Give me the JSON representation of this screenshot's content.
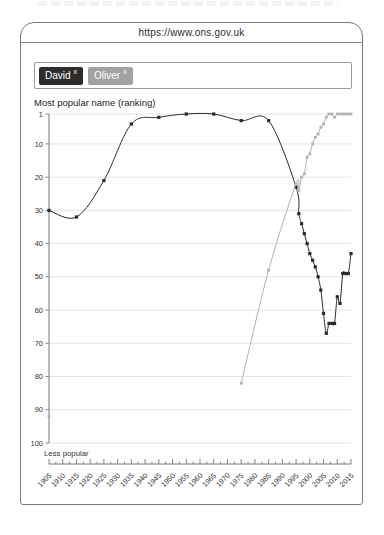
{
  "browser": {
    "url": "https://www.ons.gov.uk"
  },
  "search": {
    "chips": [
      {
        "label": "David",
        "remove_symbol": "x",
        "bg": "#2d2d2d"
      },
      {
        "label": "Oliver",
        "remove_symbol": "x",
        "bg": "#a2a2a2"
      }
    ]
  },
  "chart_data": {
    "type": "line",
    "title": "Most popular name (ranking)",
    "footer_label": "Less popular",
    "grid": true,
    "legend_position": "none",
    "y_axis": {
      "ticks": [
        1,
        10,
        20,
        30,
        40,
        50,
        60,
        70,
        80,
        90,
        100
      ],
      "range": [
        1,
        100
      ],
      "inverted": true
    },
    "x_axis": {
      "ticks": [
        1905,
        1910,
        1915,
        1920,
        1925,
        1930,
        1935,
        1940,
        1945,
        1950,
        1955,
        1960,
        1965,
        1970,
        1975,
        1980,
        1985,
        1990,
        1995,
        2000,
        2005,
        2010,
        2015
      ],
      "range": [
        1905,
        2015
      ]
    },
    "series": [
      {
        "name": "David",
        "color": "#2b2b2b",
        "marker": 3.2,
        "points": [
          [
            1905,
            30
          ],
          [
            1915,
            32
          ],
          [
            1925,
            21
          ],
          [
            1935,
            4
          ],
          [
            1945,
            2
          ],
          [
            1955,
            1
          ],
          [
            1965,
            1
          ],
          [
            1975,
            3
          ],
          [
            1985,
            3
          ],
          [
            1995,
            23
          ],
          [
            1996,
            31
          ],
          [
            1997,
            34
          ],
          [
            1998,
            37
          ],
          [
            1999,
            40
          ],
          [
            2000,
            43
          ],
          [
            2001,
            45
          ],
          [
            2002,
            47
          ],
          [
            2003,
            50
          ],
          [
            2004,
            54
          ],
          [
            2005,
            61
          ],
          [
            2006,
            67
          ],
          [
            2007,
            64
          ],
          [
            2008,
            64
          ],
          [
            2009,
            64
          ],
          [
            2010,
            56
          ],
          [
            2011,
            58
          ],
          [
            2012,
            49
          ],
          [
            2013,
            49
          ],
          [
            2014,
            49
          ],
          [
            2015,
            43
          ]
        ]
      },
      {
        "name": "Oliver",
        "color": "#b2b2b2",
        "marker": 2.8,
        "points": [
          [
            1905,
            92
          ],
          [
            1975,
            82
          ],
          [
            1985,
            48
          ],
          [
            1995,
            22
          ],
          [
            1996,
            24
          ],
          [
            1997,
            20
          ],
          [
            1998,
            19
          ],
          [
            1999,
            14
          ],
          [
            2000,
            13
          ],
          [
            2001,
            10
          ],
          [
            2002,
            8
          ],
          [
            2003,
            7
          ],
          [
            2004,
            5
          ],
          [
            2005,
            4
          ],
          [
            2006,
            2
          ],
          [
            2007,
            1
          ],
          [
            2008,
            1
          ],
          [
            2009,
            2
          ],
          [
            2010,
            1
          ],
          [
            2011,
            1
          ],
          [
            2012,
            1
          ],
          [
            2013,
            1
          ],
          [
            2014,
            1
          ],
          [
            2015,
            1
          ]
        ]
      }
    ]
  }
}
